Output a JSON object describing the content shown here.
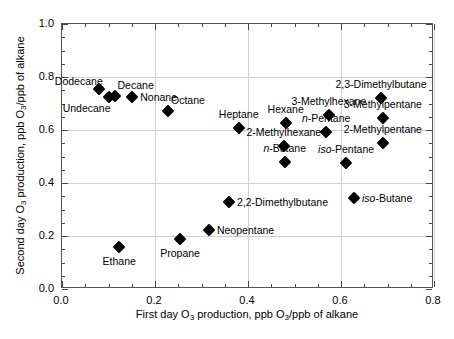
{
  "chart_data": {
    "type": "scatter",
    "title": "",
    "xlabel": "First day O3 production, ppb O3/ppb of alkane",
    "ylabel": "Second day O3 production, ppb O3/ppb of alkane",
    "xlim": [
      0.0,
      0.8
    ],
    "ylim": [
      0.0,
      1.0
    ],
    "xticks": [
      "0.0",
      "0.2",
      "0.4",
      "0.6",
      "0.8"
    ],
    "xtick_values": [
      0.0,
      0.2,
      0.4,
      0.6,
      0.8
    ],
    "yticks": [
      "0.0",
      "0.2",
      "0.4",
      "0.6",
      "0.8",
      "1.0"
    ],
    "ytick_values": [
      0.0,
      0.2,
      0.4,
      0.6,
      0.8,
      1.0
    ],
    "x_minor_step": 0.05,
    "y_minor_step": 0.05,
    "grid": true,
    "legend": "none",
    "marker": "filled-diamond",
    "marker_color": "#000000",
    "points": [
      {
        "label": "Dodecane",
        "x": 0.079,
        "y": 0.755,
        "label_pos": "above-left"
      },
      {
        "label": "Undecane",
        "x": 0.1,
        "y": 0.726,
        "label_pos": "below-left"
      },
      {
        "label": "Decane",
        "x": 0.113,
        "y": 0.73,
        "label_pos": "above-right"
      },
      {
        "label": "Nonane",
        "x": 0.151,
        "y": 0.723,
        "label_pos": "right"
      },
      {
        "label": "Octane",
        "x": 0.228,
        "y": 0.672,
        "label_pos": "above-right"
      },
      {
        "label": "Heptane",
        "x": 0.38,
        "y": 0.607,
        "label_pos": "above"
      },
      {
        "label": "Hexane",
        "x": 0.481,
        "y": 0.626,
        "label_pos": "above"
      },
      {
        "label": "3-Methylhexane",
        "x": 0.574,
        "y": 0.657,
        "label_pos": "above"
      },
      {
        "label": "2,3-Dimethylbutane",
        "x": 0.686,
        "y": 0.721,
        "label_pos": "above"
      },
      {
        "label": "3-Methylpentane",
        "x": 0.69,
        "y": 0.645,
        "label_pos": "above"
      },
      {
        "label": "n-Pentane",
        "x": 0.568,
        "y": 0.593,
        "label_pos": "above",
        "italic_prefix": "n"
      },
      {
        "label": "2-Methylpentane",
        "x": 0.69,
        "y": 0.551,
        "label_pos": "above"
      },
      {
        "label": "2-Methylhexane",
        "x": 0.477,
        "y": 0.54,
        "label_pos": "above"
      },
      {
        "label": "iso-Pentane",
        "x": 0.611,
        "y": 0.476,
        "label_pos": "above",
        "italic_prefix": "iso"
      },
      {
        "label": "n-Butane",
        "x": 0.479,
        "y": 0.479,
        "label_pos": "above",
        "italic_prefix": "n"
      },
      {
        "label": "iso-Butane",
        "x": 0.628,
        "y": 0.344,
        "label_pos": "right",
        "italic_prefix": "iso"
      },
      {
        "label": "2,2-Dimethylbutane",
        "x": 0.359,
        "y": 0.328,
        "label_pos": "right"
      },
      {
        "label": "Neopentane",
        "x": 0.316,
        "y": 0.223,
        "label_pos": "right"
      },
      {
        "label": "Propane",
        "x": 0.254,
        "y": 0.189,
        "label_pos": "below"
      },
      {
        "label": "Ethane",
        "x": 0.123,
        "y": 0.159,
        "label_pos": "below"
      }
    ]
  },
  "axes": {
    "x_title_parts": {
      "pre": "First day O",
      "sub1": "3",
      "mid": " production, ppb O",
      "sub2": "3",
      "post": "/ppb of alkane"
    },
    "y_title_parts": {
      "pre": "Second day O",
      "sub1": "3",
      "mid": " production, ppb O",
      "sub2": "3",
      "post": "/ppb of alkane"
    }
  },
  "colors": {
    "marker": "#000000",
    "grid": "#d0d0d0",
    "frame": "#555555",
    "background": "#ffffff"
  }
}
